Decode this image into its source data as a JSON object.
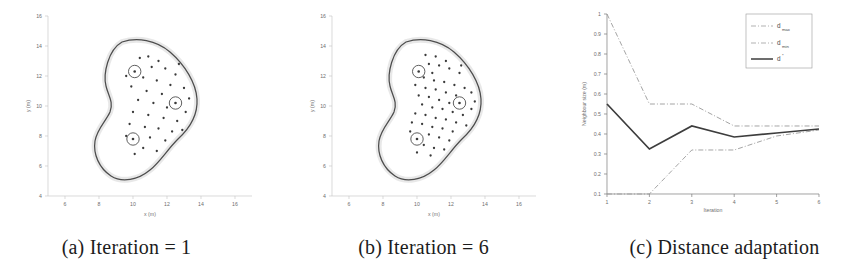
{
  "figure": {
    "panel_count": 3
  },
  "captions": {
    "a": "(a) Iteration = 1",
    "b": "(b) Iteration = 6",
    "c": "(c) Distance adaptation"
  },
  "chart_data": [
    {
      "type": "scatter",
      "panel": "a",
      "title": "",
      "xlabel": "x (m)",
      "ylabel": "y (m)",
      "xlim": [
        5,
        17
      ],
      "ylim": [
        4,
        16
      ],
      "xticks": [
        6,
        8,
        10,
        12,
        14,
        16
      ],
      "yticks": [
        4,
        6,
        8,
        10,
        12,
        14,
        16
      ],
      "grid": false,
      "legend": "none",
      "annotations": [
        "blob boundary contour",
        "sparse irregular node scatter",
        "3 circled anchor nodes"
      ],
      "anchor_nodes": [
        {
          "x": 10.1,
          "y": 12.3
        },
        {
          "x": 12.5,
          "y": 10.2
        },
        {
          "x": 10.0,
          "y": 7.8
        }
      ],
      "nodes": [
        {
          "x": 10.9,
          "y": 13.3
        },
        {
          "x": 11.5,
          "y": 13.0
        },
        {
          "x": 10.4,
          "y": 13.2
        },
        {
          "x": 11.1,
          "y": 12.6
        },
        {
          "x": 11.9,
          "y": 12.5
        },
        {
          "x": 12.5,
          "y": 12.1
        },
        {
          "x": 10.6,
          "y": 11.9
        },
        {
          "x": 11.4,
          "y": 11.7
        },
        {
          "x": 12.2,
          "y": 11.4
        },
        {
          "x": 13.0,
          "y": 11.2
        },
        {
          "x": 9.9,
          "y": 11.3
        },
        {
          "x": 10.8,
          "y": 11.0
        },
        {
          "x": 11.7,
          "y": 10.8
        },
        {
          "x": 13.3,
          "y": 10.5
        },
        {
          "x": 10.3,
          "y": 10.4
        },
        {
          "x": 11.2,
          "y": 10.2
        },
        {
          "x": 12.0,
          "y": 9.9
        },
        {
          "x": 13.1,
          "y": 9.6
        },
        {
          "x": 10.0,
          "y": 9.6
        },
        {
          "x": 10.9,
          "y": 9.4
        },
        {
          "x": 11.8,
          "y": 9.2
        },
        {
          "x": 12.6,
          "y": 9.0
        },
        {
          "x": 9.8,
          "y": 8.8
        },
        {
          "x": 10.7,
          "y": 8.6
        },
        {
          "x": 11.5,
          "y": 8.5
        },
        {
          "x": 12.3,
          "y": 8.3
        },
        {
          "x": 9.6,
          "y": 8.0
        },
        {
          "x": 11.0,
          "y": 7.9
        },
        {
          "x": 11.9,
          "y": 7.7
        },
        {
          "x": 10.6,
          "y": 7.2
        },
        {
          "x": 11.4,
          "y": 7.0
        },
        {
          "x": 10.1,
          "y": 6.8
        },
        {
          "x": 12.7,
          "y": 12.8
        },
        {
          "x": 9.6,
          "y": 12.0
        },
        {
          "x": 12.9,
          "y": 8.4
        }
      ]
    },
    {
      "type": "scatter",
      "panel": "b",
      "title": "",
      "xlabel": "x (m)",
      "ylabel": "y (m)",
      "xlim": [
        5,
        17
      ],
      "ylim": [
        4,
        16
      ],
      "xticks": [
        6,
        8,
        10,
        12,
        14,
        16
      ],
      "yticks": [
        4,
        6,
        8,
        10,
        12,
        14,
        16
      ],
      "grid": false,
      "legend": "none",
      "annotations": [
        "blob boundary contour",
        "dense regularised node lattice",
        "3 circled anchor nodes"
      ],
      "anchor_nodes": [
        {
          "x": 10.1,
          "y": 12.3
        },
        {
          "x": 12.5,
          "y": 10.2
        },
        {
          "x": 10.0,
          "y": 7.8
        }
      ],
      "nodes": [
        {
          "x": 10.5,
          "y": 13.4
        },
        {
          "x": 11.1,
          "y": 13.3
        },
        {
          "x": 11.7,
          "y": 13.0
        },
        {
          "x": 10.7,
          "y": 12.8
        },
        {
          "x": 11.3,
          "y": 12.7
        },
        {
          "x": 11.9,
          "y": 12.5
        },
        {
          "x": 12.5,
          "y": 12.2
        },
        {
          "x": 10.9,
          "y": 12.2
        },
        {
          "x": 10.4,
          "y": 11.9
        },
        {
          "x": 11.0,
          "y": 11.7
        },
        {
          "x": 11.6,
          "y": 11.6
        },
        {
          "x": 12.2,
          "y": 11.4
        },
        {
          "x": 12.8,
          "y": 11.2
        },
        {
          "x": 13.2,
          "y": 10.9
        },
        {
          "x": 9.9,
          "y": 11.4
        },
        {
          "x": 10.5,
          "y": 11.2
        },
        {
          "x": 11.1,
          "y": 11.1
        },
        {
          "x": 11.7,
          "y": 10.9
        },
        {
          "x": 12.3,
          "y": 10.7
        },
        {
          "x": 13.4,
          "y": 10.3
        },
        {
          "x": 10.1,
          "y": 10.7
        },
        {
          "x": 10.7,
          "y": 10.6
        },
        {
          "x": 11.3,
          "y": 10.4
        },
        {
          "x": 11.9,
          "y": 10.2
        },
        {
          "x": 13.2,
          "y": 9.8
        },
        {
          "x": 10.3,
          "y": 10.1
        },
        {
          "x": 10.9,
          "y": 9.9
        },
        {
          "x": 11.5,
          "y": 9.8
        },
        {
          "x": 12.1,
          "y": 9.6
        },
        {
          "x": 12.7,
          "y": 9.4
        },
        {
          "x": 9.9,
          "y": 9.5
        },
        {
          "x": 10.5,
          "y": 9.4
        },
        {
          "x": 11.1,
          "y": 9.2
        },
        {
          "x": 11.7,
          "y": 9.1
        },
        {
          "x": 12.3,
          "y": 8.9
        },
        {
          "x": 9.7,
          "y": 8.9
        },
        {
          "x": 10.3,
          "y": 8.8
        },
        {
          "x": 10.9,
          "y": 8.6
        },
        {
          "x": 11.5,
          "y": 8.5
        },
        {
          "x": 12.1,
          "y": 8.3
        },
        {
          "x": 9.6,
          "y": 8.3
        },
        {
          "x": 10.7,
          "y": 8.1
        },
        {
          "x": 11.3,
          "y": 7.9
        },
        {
          "x": 11.9,
          "y": 7.7
        },
        {
          "x": 10.4,
          "y": 7.4
        },
        {
          "x": 11.0,
          "y": 7.2
        },
        {
          "x": 11.6,
          "y": 7.1
        },
        {
          "x": 10.0,
          "y": 6.9
        },
        {
          "x": 10.8,
          "y": 6.7
        },
        {
          "x": 12.6,
          "y": 12.7
        },
        {
          "x": 12.9,
          "y": 8.7
        }
      ]
    },
    {
      "type": "line",
      "panel": "c",
      "title": "",
      "xlabel": "Iteration",
      "ylabel": "Neighbour size (m)",
      "xlim": [
        1,
        6
      ],
      "ylim": [
        0.1,
        1.0
      ],
      "xticks": [
        1,
        2,
        3,
        4,
        5,
        6
      ],
      "yticks": [
        0.1,
        0.2,
        0.3,
        0.4,
        0.5,
        0.6,
        0.7,
        0.8,
        0.9,
        1
      ],
      "ytick_labels": [
        "0.1",
        "0.2",
        "0.3",
        "0.4",
        "0.5",
        "0.6",
        "0.7",
        "0.8",
        "0.9",
        "1"
      ],
      "grid": false,
      "legend_position": "top-right",
      "x": [
        1,
        2,
        3,
        4,
        5,
        6
      ],
      "series": [
        {
          "name": "d_max",
          "label_base": "d",
          "label_sub": "max",
          "style": "dash-dot",
          "color": "#9a9a9a",
          "values": [
            1.0,
            0.55,
            0.55,
            0.44,
            0.44,
            0.44
          ]
        },
        {
          "name": "d_min",
          "label_base": "d",
          "label_sub": "min",
          "style": "dash-dot",
          "color": "#9a9a9a",
          "values": [
            0.1,
            0.1,
            0.32,
            0.32,
            0.39,
            0.42
          ]
        },
        {
          "name": "d_star",
          "label_base": "d",
          "label_sub": "*",
          "style": "solid",
          "color": "#3d3d3d",
          "values": [
            0.55,
            0.325,
            0.44,
            0.385,
            0.405,
            0.425
          ]
        }
      ]
    }
  ]
}
